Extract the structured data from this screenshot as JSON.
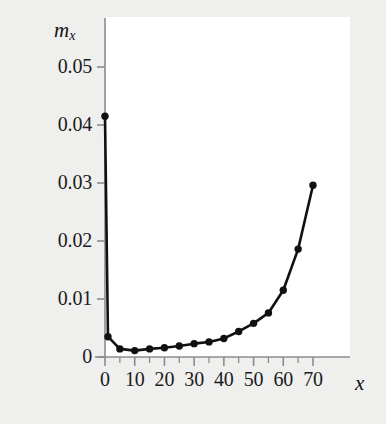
{
  "chart_data": {
    "type": "line",
    "title": "",
    "subtitle": "",
    "xlabel": "x",
    "ylabel": "m_x",
    "ylabel_base": "m",
    "ylabel_sub": "x",
    "xlim": [
      0,
      74
    ],
    "ylim": [
      0,
      0.053
    ],
    "grid": false,
    "legend": null,
    "marker": "filled-circle",
    "line_color": "#111111",
    "marker_color": "#111111",
    "background_color": "#efefee",
    "plot_background_color": "#ffffff",
    "axis_color": "#8c8c8c",
    "xticks": [
      0,
      10,
      20,
      30,
      40,
      50,
      60,
      70
    ],
    "xtick_labels": [
      "0",
      "10",
      "20",
      "30",
      "40",
      "50",
      "60",
      "70"
    ],
    "xminor_ticks": [
      5,
      15,
      25,
      35,
      45,
      55,
      65
    ],
    "yticks": [
      0,
      0.01,
      0.02,
      0.03,
      0.04,
      0.05
    ],
    "ytick_labels": [
      "0",
      "0.01",
      "0.02",
      "0.03",
      "0.04",
      "0.05"
    ],
    "x": [
      0,
      1,
      5,
      10,
      15,
      20,
      25,
      30,
      35,
      40,
      45,
      50,
      55,
      60,
      65,
      70
    ],
    "values": [
      0.0415,
      0.0035,
      0.0014,
      0.0011,
      0.0014,
      0.0016,
      0.0019,
      0.0023,
      0.0026,
      0.0032,
      0.0044,
      0.0058,
      0.0076,
      0.0115,
      0.0186,
      0.0296
    ],
    "annotations": []
  },
  "figure": {
    "name": "mortality-rate-curve"
  }
}
